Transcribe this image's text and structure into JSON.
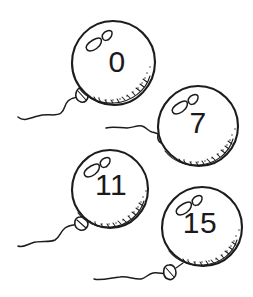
{
  "illustration": {
    "title": "Four numbered balloons",
    "style": "hand-drawn black ink line art",
    "background_color": "#ffffff",
    "ink_color": "#1c1c1c",
    "balloon_count": 4
  },
  "balloons": [
    {
      "id": "balloon-0",
      "number": "0",
      "position": "top-left",
      "center_x": 113,
      "center_y": 63,
      "radius": 42,
      "number_x": 117,
      "number_y": 61,
      "highlight_name": "balloon-highlight",
      "knot_name": "balloon-knot",
      "string_name": "balloon-string"
    },
    {
      "id": "balloon-7",
      "number": "7",
      "position": "upper-right",
      "center_x": 198,
      "center_y": 126,
      "radius": 40,
      "number_x": 198,
      "number_y": 122,
      "highlight_name": "balloon-highlight",
      "knot_name": "balloon-knot",
      "string_name": "balloon-string"
    },
    {
      "id": "balloon-11",
      "number": "11",
      "position": "lower-left",
      "center_x": 110,
      "center_y": 189,
      "radius": 39,
      "number_x": 111,
      "number_y": 184,
      "highlight_name": "balloon-highlight",
      "knot_name": "balloon-knot",
      "string_name": "balloon-string"
    },
    {
      "id": "balloon-15",
      "number": "15",
      "position": "bottom-right",
      "center_x": 202,
      "center_y": 227,
      "radius": 40,
      "number_x": 200,
      "number_y": 222,
      "highlight_name": "balloon-highlight",
      "knot_name": "balloon-knot",
      "string_name": "balloon-string"
    }
  ]
}
